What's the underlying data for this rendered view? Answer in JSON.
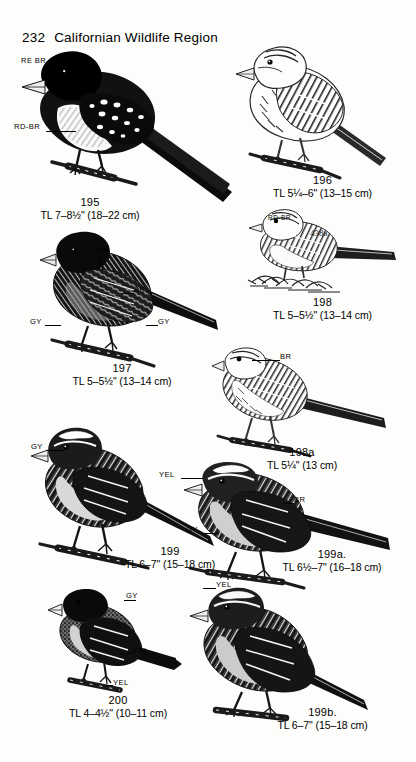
{
  "page": {
    "folio": "232",
    "running_head": "Californian Wildlife Region",
    "plate_marginalia": "438a"
  },
  "entries": [
    {
      "id": "195",
      "number": "195",
      "measurement": "TL 7–8½\" (18–22 cm)",
      "labels": [
        "RE BR",
        "RD-BR"
      ]
    },
    {
      "id": "196",
      "number": "196",
      "measurement": "TL 5¼–6\" (13–15 cm)",
      "labels": []
    },
    {
      "id": "198",
      "number": "198",
      "measurement": "TL 5–5½\" (13–14 cm)",
      "labels": [
        "RD-BR"
      ]
    },
    {
      "id": "197",
      "number": "197",
      "measurement": "TL 5–5½\" (13–14 cm)",
      "labels": [
        "GY",
        "BR",
        "GY",
        "GY"
      ]
    },
    {
      "id": "198a",
      "number": "198a",
      "measurement": "TL 5¼\" (13 cm)",
      "labels": [
        "BR"
      ]
    },
    {
      "id": "199",
      "number": "199",
      "measurement": "TL 6–7\" (15–18 cm)",
      "labels": [
        "GY"
      ]
    },
    {
      "id": "199a",
      "number": "199a.",
      "measurement": "TL 6½–7\" (16–18 cm)",
      "labels": [
        "YEL",
        "BR",
        "GY"
      ]
    },
    {
      "id": "200",
      "number": "200",
      "measurement": "TL 4–4½\" (10–11 cm)",
      "labels": [
        "GY",
        "YEL",
        "YEL"
      ]
    },
    {
      "id": "199b",
      "number": "199b.",
      "measurement": "TL 6–7\" (15–18 cm)",
      "labels": [
        "YEL"
      ]
    }
  ],
  "annotations": {
    "re_br": "RE BR",
    "rd_br_195": "RD-BR",
    "rd_br_198": "RD-BR",
    "gy_197_top": "GY",
    "br_197": "BR",
    "gy_197_left": "GY",
    "gy_197_right": "GY",
    "br_198a": "BR",
    "gy_199": "GY",
    "yel_199a": "YEL",
    "br_199a": "BR",
    "gy_199a": "GY",
    "gy_200": "GY",
    "yel_200_mid": "YEL",
    "yel_200_low": "YEL",
    "yel_199b": "YEL"
  },
  "colors": {
    "ink": "#000000",
    "paper": "#fdfdfb"
  }
}
